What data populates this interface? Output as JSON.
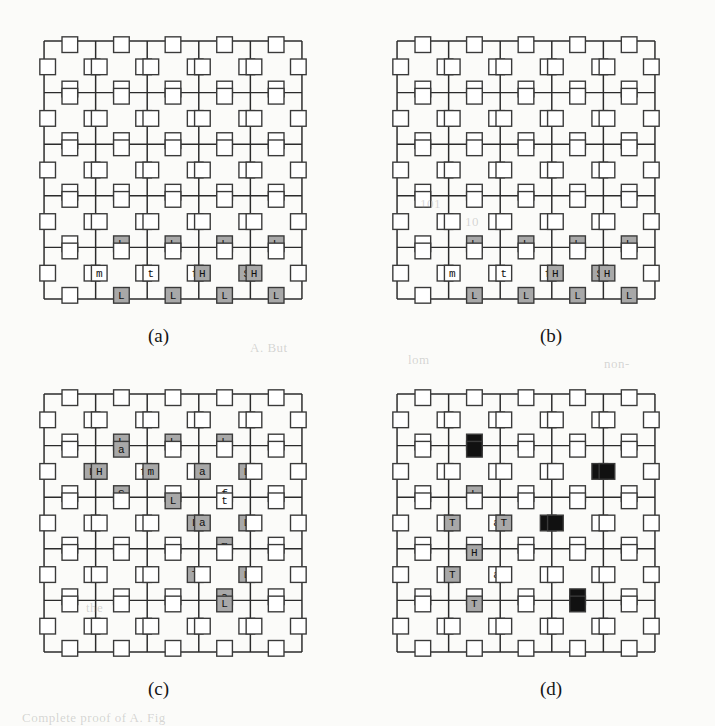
{
  "figure": {
    "type": "lattice-diagram-set",
    "panel_count": 4,
    "grid_cells_per_side": 5,
    "sites_per_cell": 4,
    "site_layout": "diamond",
    "colors": {
      "line": "#2b2b2b",
      "site_stroke": "#3a3a3a",
      "site_empty_fill": "#ffffff",
      "site_shaded_fill": "#a8a8a8",
      "site_black_fill": "#111111",
      "page_background": "#fbfbf9",
      "caption_text": "#141414"
    }
  },
  "panels": [
    {
      "id": "a",
      "caption": "(a)",
      "sites": [
        {
          "col": 1,
          "row": 3,
          "pos": "bottom",
          "label": "L",
          "fill": "shaded"
        },
        {
          "col": 2,
          "row": 3,
          "pos": "bottom",
          "label": "L",
          "fill": "shaded"
        },
        {
          "col": 3,
          "row": 3,
          "pos": "bottom",
          "label": "L",
          "fill": "shaded"
        },
        {
          "col": 4,
          "row": 3,
          "pos": "bottom",
          "label": "L",
          "fill": "shaded"
        },
        {
          "col": 1,
          "row": 4,
          "pos": "left",
          "label": "m",
          "fill": "empty"
        },
        {
          "col": 2,
          "row": 4,
          "pos": "left",
          "label": "t",
          "fill": "empty"
        },
        {
          "col": 2,
          "row": 4,
          "pos": "right",
          "label": "f",
          "fill": "empty"
        },
        {
          "col": 3,
          "row": 4,
          "pos": "left",
          "label": "H",
          "fill": "shaded"
        },
        {
          "col": 3,
          "row": 4,
          "pos": "right",
          "label": "S",
          "fill": "shaded"
        },
        {
          "col": 4,
          "row": 4,
          "pos": "left",
          "label": "H",
          "fill": "shaded"
        },
        {
          "col": 1,
          "row": 4,
          "pos": "bottom",
          "label": "L",
          "fill": "shaded"
        },
        {
          "col": 2,
          "row": 4,
          "pos": "bottom",
          "label": "L",
          "fill": "shaded"
        },
        {
          "col": 3,
          "row": 4,
          "pos": "bottom",
          "label": "L",
          "fill": "shaded"
        },
        {
          "col": 4,
          "row": 4,
          "pos": "bottom",
          "label": "L",
          "fill": "shaded"
        }
      ]
    },
    {
      "id": "b",
      "caption": "(b)",
      "sites": [
        {
          "col": 1,
          "row": 3,
          "pos": "bottom",
          "label": "L",
          "fill": "shaded"
        },
        {
          "col": 2,
          "row": 3,
          "pos": "bottom",
          "label": "L",
          "fill": "shaded"
        },
        {
          "col": 3,
          "row": 3,
          "pos": "bottom",
          "label": "L",
          "fill": "shaded"
        },
        {
          "col": 4,
          "row": 3,
          "pos": "bottom",
          "label": "L",
          "fill": "shaded"
        },
        {
          "col": 1,
          "row": 4,
          "pos": "left",
          "label": "m",
          "fill": "empty"
        },
        {
          "col": 2,
          "row": 4,
          "pos": "left",
          "label": "t",
          "fill": "empty"
        },
        {
          "col": 2,
          "row": 4,
          "pos": "right",
          "label": "f",
          "fill": "empty"
        },
        {
          "col": 3,
          "row": 4,
          "pos": "left",
          "label": "H",
          "fill": "shaded"
        },
        {
          "col": 3,
          "row": 4,
          "pos": "right",
          "label": "S",
          "fill": "shaded"
        },
        {
          "col": 4,
          "row": 4,
          "pos": "left",
          "label": "H",
          "fill": "shaded"
        },
        {
          "col": 1,
          "row": 4,
          "pos": "bottom",
          "label": "L",
          "fill": "shaded"
        },
        {
          "col": 2,
          "row": 4,
          "pos": "bottom",
          "label": "L",
          "fill": "shaded"
        },
        {
          "col": 3,
          "row": 4,
          "pos": "bottom",
          "label": "L",
          "fill": "shaded"
        },
        {
          "col": 4,
          "row": 4,
          "pos": "bottom",
          "label": "L",
          "fill": "shaded"
        }
      ]
    },
    {
      "id": "c",
      "caption": "(c)",
      "sites": [
        {
          "col": 1,
          "row": 0,
          "pos": "bottom",
          "label": "L",
          "fill": "shaded"
        },
        {
          "col": 2,
          "row": 0,
          "pos": "bottom",
          "label": "L",
          "fill": "shaded"
        },
        {
          "col": 3,
          "row": 0,
          "pos": "bottom",
          "label": "L",
          "fill": "shaded"
        },
        {
          "col": 1,
          "row": 1,
          "pos": "top",
          "label": "a",
          "fill": "shaded"
        },
        {
          "col": 0,
          "row": 1,
          "pos": "right",
          "label": "L",
          "fill": "shaded"
        },
        {
          "col": 1,
          "row": 1,
          "pos": "left",
          "label": "H",
          "fill": "shaded"
        },
        {
          "col": 1,
          "row": 1,
          "pos": "right",
          "label": "f",
          "fill": "empty"
        },
        {
          "col": 2,
          "row": 1,
          "pos": "left",
          "label": "m",
          "fill": "shaded"
        },
        {
          "col": 3,
          "row": 1,
          "pos": "left",
          "label": "a",
          "fill": "shaded"
        },
        {
          "col": 3,
          "row": 1,
          "pos": "right",
          "label": "L",
          "fill": "shaded"
        },
        {
          "col": 1,
          "row": 1,
          "pos": "bottom",
          "label": "S",
          "fill": "shaded"
        },
        {
          "col": 3,
          "row": 1,
          "pos": "bottom",
          "label": "f",
          "fill": "empty"
        },
        {
          "col": 2,
          "row": 2,
          "pos": "top",
          "label": "L",
          "fill": "shaded"
        },
        {
          "col": 3,
          "row": 2,
          "pos": "top",
          "label": "t",
          "fill": "empty"
        },
        {
          "col": 2,
          "row": 2,
          "pos": "right",
          "label": "L",
          "fill": "shaded"
        },
        {
          "col": 3,
          "row": 2,
          "pos": "left",
          "label": "a",
          "fill": "shaded"
        },
        {
          "col": 3,
          "row": 2,
          "pos": "right",
          "label": "L",
          "fill": "shaded"
        },
        {
          "col": 3,
          "row": 2,
          "pos": "bottom",
          "label": "m",
          "fill": "shaded"
        },
        {
          "col": 2,
          "row": 3,
          "pos": "right",
          "label": "T",
          "fill": "shaded"
        },
        {
          "col": 3,
          "row": 3,
          "pos": "right",
          "label": "L",
          "fill": "shaded"
        },
        {
          "col": 3,
          "row": 3,
          "pos": "bottom",
          "label": "a",
          "fill": "shaded"
        },
        {
          "col": 3,
          "row": 4,
          "pos": "top",
          "label": "L",
          "fill": "shaded"
        }
      ]
    },
    {
      "id": "d",
      "caption": "(d)",
      "sites": [
        {
          "col": 1,
          "row": 0,
          "pos": "bottom",
          "label": "",
          "fill": "black"
        },
        {
          "col": 1,
          "row": 1,
          "pos": "top",
          "label": "",
          "fill": "black"
        },
        {
          "col": 3,
          "row": 1,
          "pos": "right",
          "label": "",
          "fill": "black"
        },
        {
          "col": 4,
          "row": 1,
          "pos": "left",
          "label": "",
          "fill": "black"
        },
        {
          "col": 1,
          "row": 1,
          "pos": "bottom",
          "label": "L",
          "fill": "shaded"
        },
        {
          "col": 1,
          "row": 2,
          "pos": "left",
          "label": "T",
          "fill": "shaded"
        },
        {
          "col": 1,
          "row": 2,
          "pos": "right",
          "label": "a",
          "fill": "empty"
        },
        {
          "col": 2,
          "row": 2,
          "pos": "left",
          "label": "T",
          "fill": "shaded"
        },
        {
          "col": 2,
          "row": 2,
          "pos": "right",
          "label": "",
          "fill": "black"
        },
        {
          "col": 3,
          "row": 2,
          "pos": "left",
          "label": "",
          "fill": "black"
        },
        {
          "col": 1,
          "row": 3,
          "pos": "top",
          "label": "H",
          "fill": "shaded"
        },
        {
          "col": 1,
          "row": 3,
          "pos": "left",
          "label": "T",
          "fill": "shaded"
        },
        {
          "col": 1,
          "row": 3,
          "pos": "right",
          "label": "a",
          "fill": "empty"
        },
        {
          "col": 3,
          "row": 3,
          "pos": "bottom",
          "label": "",
          "fill": "black"
        },
        {
          "col": 3,
          "row": 4,
          "pos": "top",
          "label": "",
          "fill": "black"
        },
        {
          "col": 1,
          "row": 4,
          "pos": "top",
          "label": "T",
          "fill": "shaded"
        }
      ]
    }
  ],
  "background_text": [
    {
      "text": "lom",
      "x": 408,
      "y": 352
    },
    {
      "text": "A. But",
      "x": 250,
      "y": 340
    },
    {
      "text": "non-",
      "x": 604,
      "y": 356
    },
    {
      "text": "101",
      "x": 420,
      "y": 196
    },
    {
      "text": "10",
      "x": 465,
      "y": 214
    },
    {
      "text": "Complete   proof   of   A.   Fig",
      "x": 22,
      "y": 710
    },
    {
      "text": "the",
      "x": 86,
      "y": 600
    }
  ]
}
